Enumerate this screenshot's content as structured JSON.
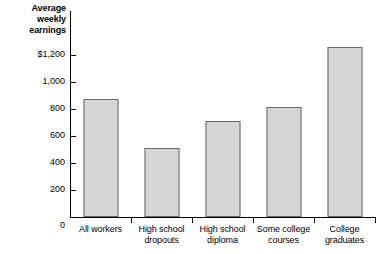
{
  "chart_data": {
    "type": "bar",
    "title": "",
    "ylabel": "Average weekly earnings",
    "ylabel_lines": [
      "Average",
      "weekly",
      "earnings"
    ],
    "xlabel": "",
    "categories": [
      "All workers",
      "High school dropouts",
      "High school diploma",
      "Some college courses",
      "College graduates"
    ],
    "category_lines": [
      [
        "All workers"
      ],
      [
        "High school",
        "dropouts"
      ],
      [
        "High school",
        "diploma"
      ],
      [
        "Some college",
        "courses"
      ],
      [
        "College",
        "graduates"
      ]
    ],
    "values": [
      790,
      460,
      645,
      740,
      1140
    ],
    "ylim": [
      0,
      1200
    ],
    "yticks": [
      0,
      200,
      400,
      600,
      800,
      1000,
      1200
    ],
    "ytick_labels": [
      "0",
      "200",
      "400",
      "600",
      "800",
      "1,000",
      "$1,200"
    ],
    "grid": false,
    "legend": false,
    "bar_fill_color": "#d6d6d6",
    "bar_edge_color": "#666666",
    "axis_color": "#000000"
  }
}
